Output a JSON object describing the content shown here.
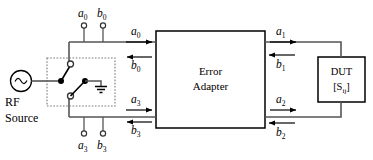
{
  "diagram": {
    "blocks": {
      "error_adapter": {
        "line1": "Error",
        "line2": "Adapter"
      },
      "dut": {
        "line1": "DUT",
        "line2_prefix": "[S",
        "line2_subscript": "ij",
        "line2_suffix": "]"
      },
      "source": {
        "line1": "RF",
        "line2": "Source",
        "symbol": "sine-wave-ac-source"
      }
    },
    "ports": {
      "top_left": [
        {
          "base": "a",
          "sub": "0"
        },
        {
          "base": "b",
          "sub": "0"
        }
      ],
      "bottom_left": [
        {
          "base": "a",
          "sub": "3"
        },
        {
          "base": "b",
          "sub": "3"
        }
      ]
    },
    "waves": {
      "top_left_in": {
        "base": "a",
        "sub": "0",
        "direction": "right"
      },
      "top_left_out": {
        "base": "b",
        "sub": "0",
        "direction": "left"
      },
      "bottom_left_in": {
        "base": "a",
        "sub": "3",
        "direction": "right"
      },
      "bottom_left_out": {
        "base": "b",
        "sub": "3",
        "direction": "left"
      },
      "top_right_out": {
        "base": "a",
        "sub": "1",
        "direction": "right"
      },
      "top_right_in": {
        "base": "b",
        "sub": "1",
        "direction": "left"
      },
      "bottom_right_out": {
        "base": "a",
        "sub": "2",
        "direction": "right"
      },
      "bottom_right_in": {
        "base": "b",
        "sub": "2",
        "direction": "left"
      }
    },
    "switch": {
      "name": "spdt-transfer-switch",
      "enclosure": "dotted-box",
      "ground_symbol": "earth-ground"
    },
    "colors": {
      "stroke": "#000000",
      "wire": "#3a3a3a",
      "background": "#ffffff"
    }
  }
}
